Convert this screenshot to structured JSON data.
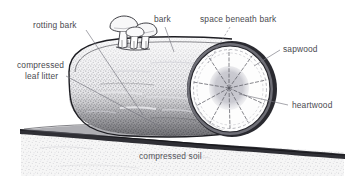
{
  "figure": {
    "width": 354,
    "height": 190,
    "background_color": "#ffffff",
    "style": "hand-drawn pen-and-ink stipple illustration"
  },
  "labels": {
    "rotting_bark": "rotting bark",
    "compressed_leaf_litter_line1": "compressed",
    "compressed_leaf_litter_line2": "leaf litter",
    "bark": "bark",
    "space_beneath_bark": "space beneath bark",
    "sapwood": "sapwood",
    "heartwood": "heartwood",
    "compressed_soil": "compressed soil"
  },
  "parts": {
    "log_body": "log-body",
    "log_end_cross_section": "log-end-cross-section",
    "sapwood_ring": "sapwood-ring",
    "heartwood_core": "heartwood-core",
    "bark_outline": "bark-outline",
    "mushroom_cluster": "mushroom-cluster",
    "leaf_litter_layer": "leaf-litter-layer",
    "soil_layer": "soil-layer",
    "ground_line": "ground-line"
  },
  "colors": {
    "ink": "#3a3a40",
    "label_text": "#4a4a50",
    "leader_line": "#76767f",
    "log_dark": "#55555b",
    "log_mid": "#8c8c92",
    "sapwood_fill": "#fdfdfd",
    "heartwood_fill": "#c9c9cf",
    "soil_fill": "#f2f2f2",
    "soil_speckle": "#9a9aa2",
    "background": "#ffffff"
  },
  "icons": {
    "mushroom": "mushroom-icon",
    "tree_rings": "tree-rings-icon"
  }
}
